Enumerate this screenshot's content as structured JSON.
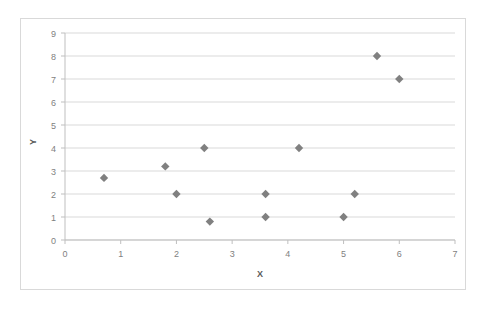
{
  "chart_data": {
    "type": "scatter",
    "title": "",
    "xlabel": "X",
    "ylabel": "Y",
    "xlim": [
      0,
      7
    ],
    "ylim": [
      0,
      9
    ],
    "xticks": [
      0,
      1,
      2,
      3,
      4,
      5,
      6,
      7
    ],
    "yticks": [
      0,
      1,
      2,
      3,
      4,
      5,
      6,
      7,
      8,
      9
    ],
    "x_tick_labels": [
      "0",
      "1",
      "2",
      "3",
      "4",
      "5",
      "6",
      "7"
    ],
    "y_tick_labels": [
      "0",
      "1",
      "2",
      "3",
      "4",
      "5",
      "6",
      "7",
      "8",
      "9"
    ],
    "grid": "horizontal",
    "legend": "none",
    "marker": "diamond",
    "marker_color": "#808080",
    "points": [
      {
        "x": 0.7,
        "y": 2.7
      },
      {
        "x": 1.8,
        "y": 3.2
      },
      {
        "x": 2.0,
        "y": 2.0
      },
      {
        "x": 2.5,
        "y": 4.0
      },
      {
        "x": 2.6,
        "y": 0.8
      },
      {
        "x": 3.6,
        "y": 2.0
      },
      {
        "x": 3.6,
        "y": 1.0
      },
      {
        "x": 4.2,
        "y": 4.0
      },
      {
        "x": 5.0,
        "y": 1.0
      },
      {
        "x": 5.2,
        "y": 2.0
      },
      {
        "x": 5.6,
        "y": 8.0
      },
      {
        "x": 6.0,
        "y": 7.0
      }
    ]
  },
  "colors": {
    "marker": "#808080",
    "gridline": "#d9d9d9",
    "axis": "#bfbfbf",
    "tick_text": "#7f7f7f",
    "axis_title_text": "#595959",
    "frame_border": "#d9d9d9",
    "background": "#ffffff"
  }
}
